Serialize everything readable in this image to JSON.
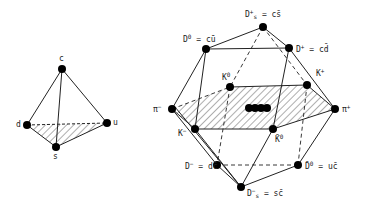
{
  "figure": {
    "tetrahedron": {
      "name": "quark tetrahedron (SU(4) quarks)",
      "vertices": [
        {
          "id": "c",
          "label": "c",
          "x": 62,
          "y": 69
        },
        {
          "id": "d",
          "label": "d",
          "x": 27,
          "y": 125
        },
        {
          "id": "u",
          "label": "u",
          "x": 107,
          "y": 123
        },
        {
          "id": "s",
          "label": "s",
          "x": 56,
          "y": 147
        }
      ]
    },
    "multiplet": {
      "name": "pseudoscalar meson 16-plet (SU(4))",
      "vertices": [
        {
          "id": "Ds_plus",
          "label": "D",
          "sup": "+",
          "sub": "s",
          "rest": " = cs̄",
          "x": 263,
          "y": 27
        },
        {
          "id": "D0",
          "label": "D",
          "sup": "0",
          "sub": "",
          "rest": " = cū",
          "x": 206,
          "y": 49
        },
        {
          "id": "D_plus",
          "label": "D",
          "sup": "+",
          "sub": "",
          "rest": " = cd̄",
          "x": 289,
          "y": 48
        },
        {
          "id": "K0",
          "label": "K",
          "sup": "0",
          "sub": "",
          "rest": "",
          "x": 230,
          "y": 87
        },
        {
          "id": "K_plus",
          "label": "K",
          "sup": "+",
          "sub": "",
          "rest": "",
          "x": 307,
          "y": 85
        },
        {
          "id": "pi_minus",
          "label": "π",
          "sup": "−",
          "sub": "",
          "rest": "",
          "x": 172,
          "y": 109
        },
        {
          "id": "pi_plus",
          "label": "π",
          "sup": "+",
          "sub": "",
          "rest": "",
          "x": 335,
          "y": 109
        },
        {
          "id": "K_minus",
          "label": "K",
          "sup": "−",
          "sub": "",
          "rest": "",
          "x": 195,
          "y": 129
        },
        {
          "id": "K0bar",
          "label": "K̄",
          "sup": "0",
          "sub": "",
          "rest": "",
          "x": 273,
          "y": 129
        },
        {
          "id": "D_minus",
          "label": "D",
          "sup": "−",
          "sub": "",
          "rest": " = dc̄",
          "x": 217,
          "y": 165
        },
        {
          "id": "D0bar",
          "label": "D̄",
          "sup": "0",
          "sub": "",
          "rest": " = uc̄",
          "x": 298,
          "y": 165
        },
        {
          "id": "Ds_minus",
          "label": "D",
          "sup": "−",
          "sub": "s",
          "rest": " = sc̄",
          "x": 241,
          "y": 187
        }
      ],
      "center_dots": 4
    }
  }
}
